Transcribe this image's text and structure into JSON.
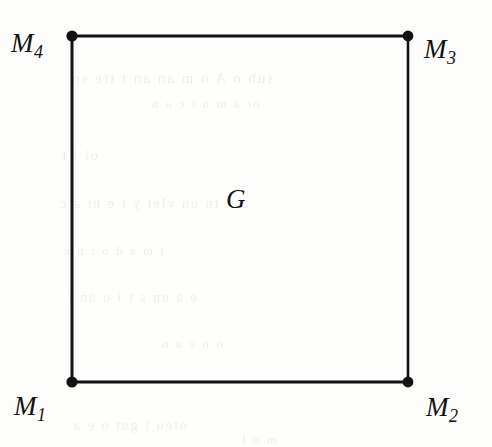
{
  "figure": {
    "kind": "geometry-diagram",
    "background_color": "#fdfdfc",
    "stroke_color": "#131313"
  },
  "region": {
    "label": "G",
    "shape": "square"
  },
  "vertices": [
    {
      "id": "m1",
      "label": "M",
      "subscript": "1",
      "position": "bottom-left"
    },
    {
      "id": "m2",
      "label": "M",
      "subscript": "2",
      "position": "bottom-right"
    },
    {
      "id": "m3",
      "label": "M",
      "subscript": "3",
      "position": "top-right"
    },
    {
      "id": "m4",
      "label": "M",
      "subscript": "4",
      "position": "top-left"
    }
  ],
  "ghost_text": [
    {
      "text": "sub  o   A  o  m  an   an      t  tte   so",
      "x": 70,
      "y": 70,
      "size": 15
    },
    {
      "text": "or a  m    u    t  c  a  n",
      "x": 150,
      "y": 96,
      "size": 13
    },
    {
      "text": "oi                  i            t",
      "x": 60,
      "y": 148,
      "size": 14
    },
    {
      "text": "tn   on  vlet y        t  e  nt    a   c",
      "x": 58,
      "y": 196,
      "size": 14
    },
    {
      "text": "t     m   a  d    o    r  n   e",
      "x": 62,
      "y": 243,
      "size": 13
    },
    {
      "text": "e  a   un  s   t   i  o   an    r",
      "x": 66,
      "y": 290,
      "size": 14
    },
    {
      "text": "o           o  e     u  n",
      "x": 160,
      "y": 336,
      "size": 13
    },
    {
      "text": "oteu    i gut              o  e  a",
      "x": 72,
      "y": 418,
      "size": 14
    },
    {
      "text": "m    n         l",
      "x": 240,
      "y": 432,
      "size": 13
    }
  ]
}
